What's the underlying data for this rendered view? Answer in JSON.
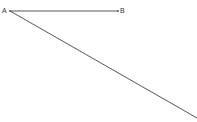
{
  "diagram": {
    "points": [
      {
        "label": "A",
        "x": 10,
        "y": 11
      },
      {
        "label": "B",
        "x": 118,
        "y": 11
      }
    ],
    "segments": [
      {
        "from": "A",
        "to": "B"
      },
      {
        "from": "A",
        "to_edge": {
          "x": 197,
          "y": 118
        }
      }
    ],
    "line_color": "#555555",
    "label_color": "#333333"
  }
}
